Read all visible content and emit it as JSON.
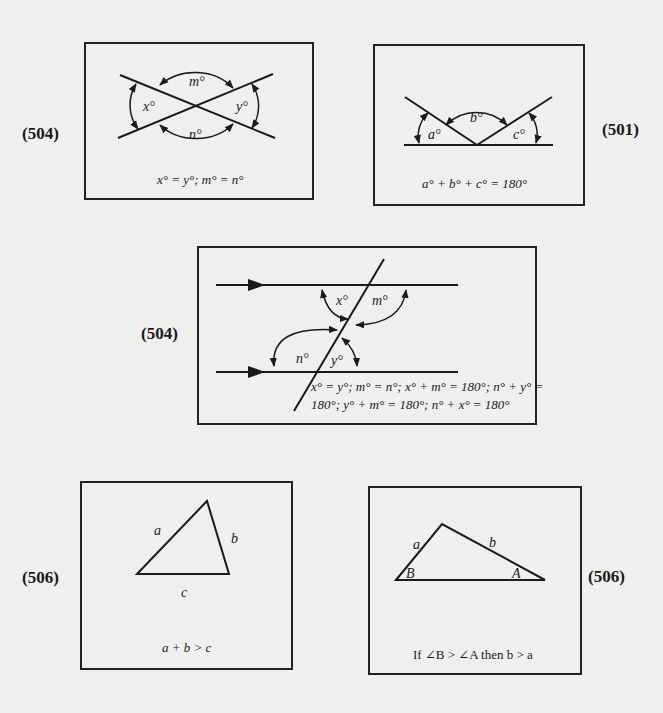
{
  "diagrams": [
    {
      "ref": "(504)",
      "title": "Vertical angles",
      "labels": {
        "x": "x°",
        "y": "y°",
        "m": "m°",
        "n": "n°"
      },
      "caption": "x° = y°; m° = n°"
    },
    {
      "ref": "(501)",
      "title": "Angles on a straight line",
      "labels": {
        "a": "a°",
        "b": "b°",
        "c": "c°"
      },
      "caption": "a° + b° + c° = 180°"
    },
    {
      "ref": "(504)",
      "title": "Parallel lines cut by a transversal",
      "labels": {
        "x": "x°",
        "m": "m°",
        "n": "n°",
        "y": "y°"
      },
      "caption_line1": "x° = y°; m° = n°; x° + m° = 180°; n° + y° =",
      "caption_line2": "180°; y° + m° = 180°; n° + x° = 180°"
    },
    {
      "ref": "(506)",
      "title": "Triangle inequality",
      "labels": {
        "a": "a",
        "b": "b",
        "c": "c"
      },
      "caption": "a + b > c"
    },
    {
      "ref": "(506)",
      "title": "Larger angle opposite larger side",
      "labels": {
        "a": "a",
        "b": "b",
        "B": "B",
        "A": "A"
      },
      "caption": "If ∠B > ∠A then b > a"
    }
  ],
  "colors": {
    "background": "#efefed",
    "ink": "#1a1a1a"
  }
}
